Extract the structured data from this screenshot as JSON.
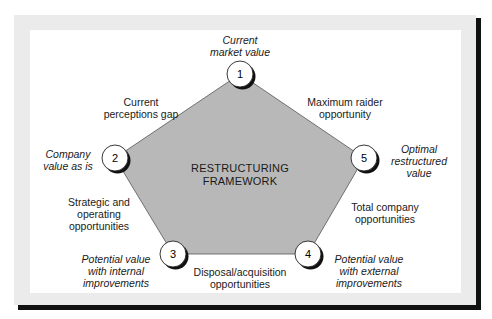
{
  "diagram": {
    "title": "RESTRUCTURING FRAMEWORK",
    "title_lines": [
      "RESTRUCTURING",
      "FRAMEWORK"
    ],
    "colors": {
      "pentagon_fill": "#b8b8b8",
      "frame": "#ebebeb",
      "shadow": "#111111",
      "node_fill": "#ffffff"
    },
    "nodes": [
      {
        "id": "1",
        "number": "1",
        "label_lines": [
          "Current",
          "market value"
        ]
      },
      {
        "id": "2",
        "number": "2",
        "label_lines": [
          "Company",
          "value as is"
        ]
      },
      {
        "id": "3",
        "number": "3",
        "label_lines": [
          "Potential value",
          "with internal",
          "improvements"
        ]
      },
      {
        "id": "4",
        "number": "4",
        "label_lines": [
          "Potential value",
          "with external",
          "improvements"
        ]
      },
      {
        "id": "5",
        "number": "5",
        "label_lines": [
          "Optimal",
          "restructured",
          "value"
        ]
      }
    ],
    "edges": [
      {
        "from": "1",
        "to": "2",
        "label_lines": [
          "Current",
          "perceptions gap"
        ]
      },
      {
        "from": "2",
        "to": "3",
        "label_lines": [
          "Strategic and",
          "operating",
          "opportunities"
        ]
      },
      {
        "from": "3",
        "to": "4",
        "label_lines": [
          "Disposal/acquisition",
          "opportunities"
        ]
      },
      {
        "from": "4",
        "to": "5",
        "label_lines": [
          "Total company",
          "opportunities"
        ]
      },
      {
        "from": "5",
        "to": "1",
        "label_lines": [
          "Maximum raider",
          "opportunity"
        ]
      }
    ]
  }
}
